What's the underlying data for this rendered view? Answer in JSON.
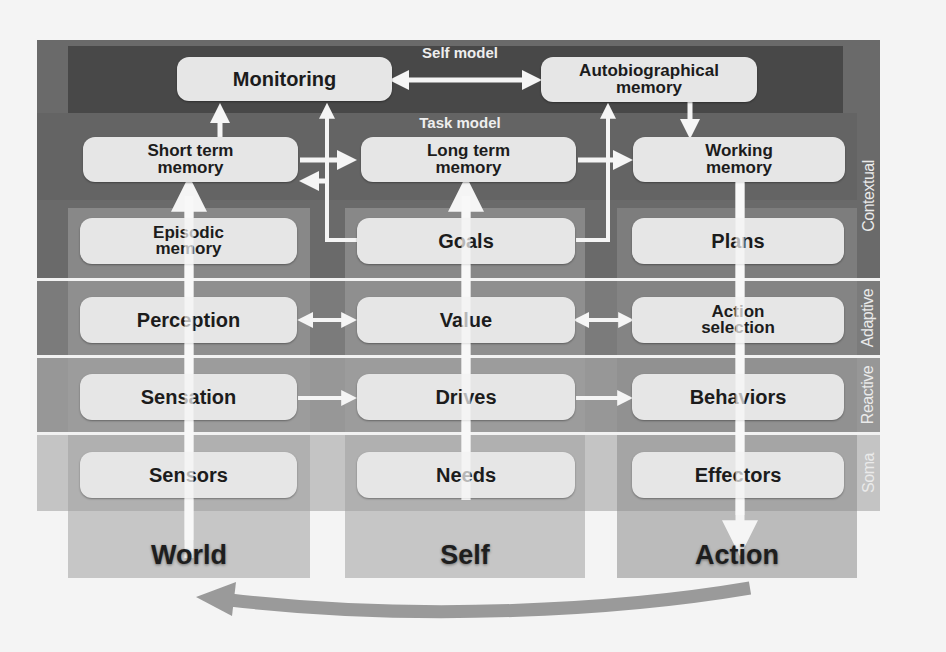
{
  "diagram": {
    "layers": [
      {
        "id": "contextual",
        "label": "Contextual",
        "color": "#616161"
      },
      {
        "id": "adaptive",
        "label": "Adaptive",
        "color": "#7b7b7b"
      },
      {
        "id": "reactive",
        "label": "Reactive",
        "color": "#979797"
      },
      {
        "id": "soma",
        "label": "Soma",
        "color": "#bdbdbd"
      }
    ],
    "sublayers": {
      "self_model": "Self model",
      "task_model": "Task model"
    },
    "self_model_boxes": {
      "monitoring": "Monitoring",
      "autobiographical": [
        "Autobiographical",
        "memory"
      ]
    },
    "task_model_boxes": {
      "short_term": [
        "Short term",
        "memory"
      ],
      "long_term": [
        "Long term",
        "memory"
      ],
      "working": [
        "Working",
        "memory"
      ]
    },
    "columns": [
      {
        "id": "world",
        "footer": "World",
        "boxes": [
          [
            "Episodic",
            "memory"
          ],
          [
            "Perception"
          ],
          [
            "Sensation"
          ],
          [
            "Sensors"
          ]
        ]
      },
      {
        "id": "self",
        "footer": "Self",
        "boxes": [
          [
            "Goals"
          ],
          [
            "Value"
          ],
          [
            "Drives"
          ],
          [
            "Needs"
          ]
        ]
      },
      {
        "id": "action",
        "footer": "Action",
        "boxes": [
          [
            "Plans"
          ],
          [
            "Action",
            "selection"
          ],
          [
            "Behaviors"
          ],
          [
            "Effectors"
          ]
        ]
      }
    ],
    "arrows": [
      {
        "from": "Self model: Monitoring",
        "to": "Autobiographical memory",
        "type": "bidirectional"
      },
      {
        "from": "Short term memory",
        "to": "Monitoring",
        "type": "up"
      },
      {
        "from": "Short term memory",
        "to": "Long term memory",
        "type": "right"
      },
      {
        "from": "Goals",
        "to": "Monitoring",
        "type": "elbow-up"
      },
      {
        "from": "Goals",
        "to": "Short term memory",
        "type": "elbow-left"
      },
      {
        "from": "Goals",
        "to": "Autobiographical memory",
        "type": "elbow-up"
      },
      {
        "from": "Long term memory",
        "to": "Working memory",
        "type": "right"
      },
      {
        "from": "Autobiographical memory",
        "to": "Working memory",
        "type": "down"
      },
      {
        "from": "World column",
        "to": "Short term memory",
        "type": "up"
      },
      {
        "from": "Self column",
        "to": "Long term memory",
        "type": "up"
      },
      {
        "from": "Working memory",
        "to": "Action",
        "type": "down"
      },
      {
        "from": "Perception",
        "to": "Value",
        "type": "bidirectional"
      },
      {
        "from": "Value",
        "to": "Action selection",
        "type": "bidirectional"
      },
      {
        "from": "Sensation",
        "to": "Drives",
        "type": "right"
      },
      {
        "from": "Drives",
        "to": "Behaviors",
        "type": "right"
      },
      {
        "from": "Action",
        "to": "World",
        "type": "curved-feedback"
      }
    ]
  }
}
